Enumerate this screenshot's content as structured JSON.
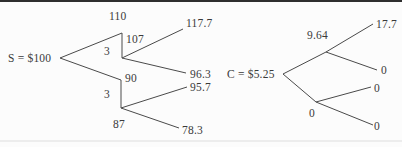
{
  "figure": {
    "background_color": "#fcfcfc",
    "line_color": "#4a4a4a",
    "text_color": "#3a3a3a",
    "top_rule_color": "#2e2e2e",
    "bottom_rule_color": "#ededed"
  },
  "stock_tree": {
    "root_label": "S = $100",
    "up_node": "110",
    "up_ex_dividend_node": "107",
    "up_dividend": "3",
    "down_node": "90",
    "down_ex_dividend_node": "87",
    "down_dividend": "3",
    "terminal_up_up": "117.7",
    "terminal_up_down": "96.3",
    "terminal_down_up": "95.7",
    "terminal_down_down": "78.3"
  },
  "call_tree": {
    "root_label": "C = $5.25",
    "up_node": "9.64",
    "down_node": "0",
    "terminal_up_up": "17.7",
    "terminal_up_down": "0",
    "terminal_down_up": "0",
    "terminal_down_down": "0"
  }
}
